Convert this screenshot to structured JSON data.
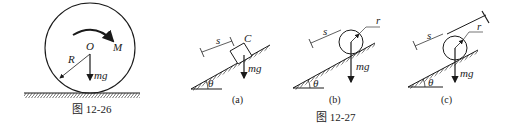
{
  "figure_12_26": {
    "caption": "图 12-26",
    "labels": {
      "center": "O",
      "moment": "M",
      "radius": "R",
      "weight": "mg"
    }
  },
  "figure_12_27": {
    "caption": "图 12-27",
    "panels": [
      {
        "id": "a",
        "sublabel": "(a)",
        "labels": {
          "distance": "s",
          "point": "C",
          "weight": "mg",
          "angle": "θ"
        }
      },
      {
        "id": "b",
        "sublabel": "(b)",
        "labels": {
          "distance": "s",
          "radius": "r",
          "weight": "mg",
          "angle": "θ"
        }
      },
      {
        "id": "c",
        "sublabel": "(c)",
        "labels": {
          "distance": "s",
          "radius": "r",
          "weight": "mg",
          "angle": "θ"
        }
      }
    ]
  }
}
